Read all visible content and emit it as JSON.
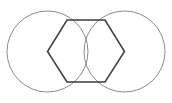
{
  "figure": {
    "canvas": {
      "width": 172,
      "height": 103,
      "background_color": "#ffffff"
    },
    "shapes": {
      "left_circle": {
        "name": "left circle",
        "center_x": 47.5,
        "center_y": 51.5,
        "radius": 40.5,
        "stroke_color": "#8c8c8c",
        "stroke_width": 1,
        "fill": "none"
      },
      "right_circle": {
        "name": "right circle",
        "center_x": 124.5,
        "center_y": 51.5,
        "radius": 40.5,
        "stroke_color": "#8c8c8c",
        "stroke_width": 1,
        "fill": "none"
      },
      "hexagon": {
        "name": "hexagon",
        "points": "67,20 105,20 124.5,51.5 105,82 67,82 47.5,51.5",
        "vertices": [
          {
            "label": "top-left",
            "x": 67,
            "y": 20
          },
          {
            "label": "top-right",
            "x": 105,
            "y": 20
          },
          {
            "label": "right",
            "x": 124.5,
            "y": 51.5
          },
          {
            "label": "bottom-right",
            "x": 105,
            "y": 82
          },
          {
            "label": "bottom-left",
            "x": 67,
            "y": 82
          },
          {
            "label": "left",
            "x": 47.5,
            "y": 51.5
          }
        ],
        "stroke_color": "#3c3c3c",
        "stroke_width": 1.5,
        "fill": "none"
      }
    }
  }
}
